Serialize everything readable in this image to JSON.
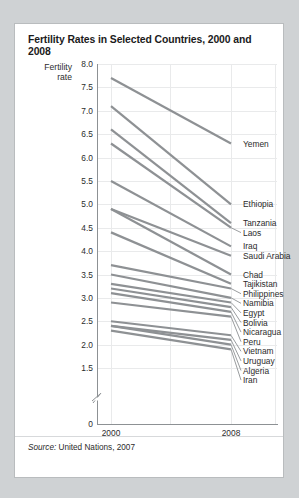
{
  "card": {
    "title": "Fertility Rates in Selected Countries, 2000 and 2008",
    "axis_caption_line1": "Fertility",
    "axis_caption_line2": "rate",
    "source_prefix": "Source:",
    "source_text": "United Nations, 2007"
  },
  "colors": {
    "line": "#8e9194",
    "grid": "#e9eaeb",
    "axis": "#8d9194",
    "card_bg": "#ffffff",
    "page_bg": "#cfd2d4",
    "text": "#2b2b2b"
  },
  "chart_data": {
    "type": "line",
    "title": "Fertility Rates in Selected Countries, 2000 and 2008",
    "xlabel": "",
    "ylabel": "Fertility rate",
    "x": [
      "2000",
      "2008"
    ],
    "xtick_labels": [
      "2000",
      "2008"
    ],
    "ytick_labels": [
      "0",
      "1.5",
      "2.0",
      "2.5",
      "3.0",
      "3.5",
      "4.0",
      "4.5",
      "5.0",
      "5.5",
      "6.0",
      "6.5",
      "7.0",
      "7.5",
      "8.0"
    ],
    "ylim": [
      1.5,
      8.0
    ],
    "y_axis_break": true,
    "y_break_label": "0",
    "grid": true,
    "legend": "right-labels",
    "series": [
      {
        "name": "Yemen",
        "values": [
          7.7,
          6.3
        ]
      },
      {
        "name": "Ethiopia",
        "values": [
          7.1,
          5.0
        ]
      },
      {
        "name": "Tanzania",
        "values": [
          6.6,
          4.6
        ]
      },
      {
        "name": "Laos",
        "values": [
          6.3,
          4.5
        ]
      },
      {
        "name": "Iraq",
        "values": [
          5.5,
          4.1
        ]
      },
      {
        "name": "Saudi Arabia",
        "values": [
          4.9,
          3.9
        ]
      },
      {
        "name": "Chad",
        "values": [
          4.9,
          3.5
        ]
      },
      {
        "name": "Tajikistan",
        "values": [
          4.4,
          3.3
        ]
      },
      {
        "name": "Philippines",
        "values": [
          3.7,
          3.2
        ]
      },
      {
        "name": "Namibia",
        "values": [
          3.5,
          3.0
        ]
      },
      {
        "name": "Egypt",
        "values": [
          3.3,
          2.9
        ]
      },
      {
        "name": "Bolivia",
        "values": [
          3.2,
          2.8
        ]
      },
      {
        "name": "Nicaragua",
        "values": [
          3.1,
          2.7
        ]
      },
      {
        "name": "Peru",
        "values": [
          2.9,
          2.6
        ]
      },
      {
        "name": "Vietnam",
        "values": [
          2.5,
          2.2
        ]
      },
      {
        "name": "Uruguay",
        "values": [
          2.4,
          2.1
        ]
      },
      {
        "name": "Algeria",
        "values": [
          2.4,
          2.0
        ]
      },
      {
        "name": "Iran",
        "values": [
          2.3,
          1.9
        ]
      }
    ],
    "source": "Source: United Nations, 2007"
  }
}
